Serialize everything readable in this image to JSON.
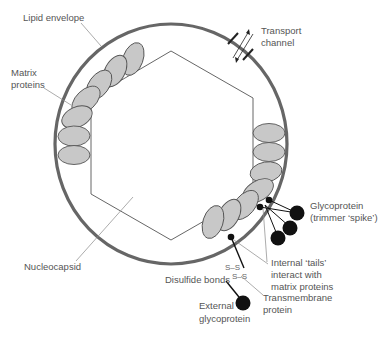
{
  "figure": {
    "colors": {
      "envelope": "#666666",
      "matrix_protein_fill": "#c8c8c8",
      "matrix_protein_stroke": "#555555",
      "nucleocapsid_stroke": "#555555",
      "glycoprotein": "#111111",
      "label_text": "#555555",
      "leader_line": "#888888"
    }
  },
  "labels": {
    "lipid_envelope": "Lipid envelope",
    "matrix_proteins_line1": "Matrix",
    "matrix_proteins_line2": "proteins",
    "transport_channel_line1": "Transport",
    "transport_channel_line2": "channel",
    "glycoprotein_line1": "Glycoprotein",
    "glycoprotein_line2": "(trimmer ‘spike’)",
    "nucleocapsid": "Nucleocapsid",
    "internal_tails_line1": "Internal ‘tails’",
    "internal_tails_line2": "interact with",
    "internal_tails_line3": "matrix proteins",
    "disulfide_bonds": "Disulfide bonds",
    "transmembrane_line1": "Transmembrane",
    "transmembrane_line2": "protein",
    "external_glycoprotein_line1": "External",
    "external_glycoprotein_line2": "glycoprotein",
    "ss_bond_1": "S–S",
    "ss_bond_2": "S–S"
  }
}
